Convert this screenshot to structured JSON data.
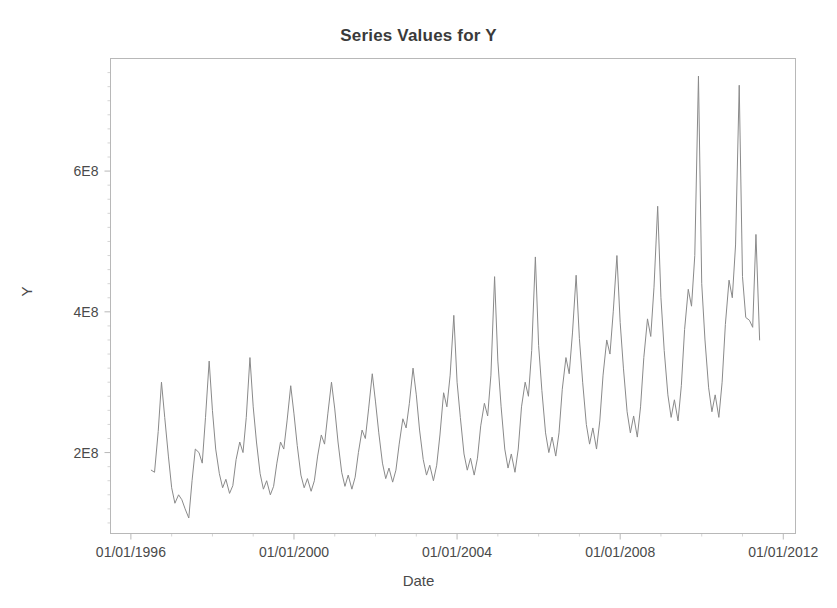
{
  "chart_data": {
    "type": "line",
    "title": "Series Values for Y",
    "xlabel": "Date",
    "ylabel": "Y",
    "grid": false,
    "legend": "none",
    "xtick_labels": [
      "01/01/1996",
      "01/01/2000",
      "01/01/2004",
      "01/01/2008",
      "01/01/2012"
    ],
    "xtick_values": [
      1996.0,
      2000.0,
      2004.0,
      2008.0,
      2012.0
    ],
    "ytick_labels": [
      "2E8",
      "4E8",
      "6E8"
    ],
    "ytick_values": [
      200000000,
      400000000,
      600000000
    ],
    "xlim": [
      1995.5,
      2012.3
    ],
    "ylim": [
      85000000,
      760000000
    ],
    "line_color": "#8a8a8a",
    "axis_color": "#b8b8b8",
    "series": [
      {
        "name": "Y",
        "x": [
          1996.5,
          1996.58,
          1996.67,
          1996.75,
          1996.83,
          1996.92,
          1997.0,
          1997.08,
          1997.17,
          1997.25,
          1997.33,
          1997.42,
          1997.5,
          1997.58,
          1997.67,
          1997.75,
          1997.83,
          1997.92,
          1998.0,
          1998.08,
          1998.17,
          1998.25,
          1998.33,
          1998.42,
          1998.5,
          1998.58,
          1998.67,
          1998.75,
          1998.83,
          1998.92,
          1999.0,
          1999.08,
          1999.17,
          1999.25,
          1999.33,
          1999.42,
          1999.5,
          1999.58,
          1999.67,
          1999.75,
          1999.83,
          1999.92,
          2000.0,
          2000.08,
          2000.17,
          2000.25,
          2000.33,
          2000.42,
          2000.5,
          2000.58,
          2000.67,
          2000.75,
          2000.83,
          2000.92,
          2001.0,
          2001.08,
          2001.17,
          2001.25,
          2001.33,
          2001.42,
          2001.5,
          2001.58,
          2001.67,
          2001.75,
          2001.83,
          2001.92,
          2002.0,
          2002.08,
          2002.17,
          2002.25,
          2002.33,
          2002.42,
          2002.5,
          2002.58,
          2002.67,
          2002.75,
          2002.83,
          2002.92,
          2003.0,
          2003.08,
          2003.17,
          2003.25,
          2003.33,
          2003.42,
          2003.5,
          2003.58,
          2003.67,
          2003.75,
          2003.83,
          2003.92,
          2004.0,
          2004.08,
          2004.17,
          2004.25,
          2004.33,
          2004.42,
          2004.5,
          2004.58,
          2004.67,
          2004.75,
          2004.83,
          2004.92,
          2005.0,
          2005.08,
          2005.17,
          2005.25,
          2005.33,
          2005.42,
          2005.5,
          2005.58,
          2005.67,
          2005.75,
          2005.83,
          2005.92,
          2006.0,
          2006.08,
          2006.17,
          2006.25,
          2006.33,
          2006.42,
          2006.5,
          2006.58,
          2006.67,
          2006.75,
          2006.83,
          2006.92,
          2007.0,
          2007.08,
          2007.17,
          2007.25,
          2007.33,
          2007.42,
          2007.5,
          2007.58,
          2007.67,
          2007.75,
          2007.83,
          2007.92,
          2008.0,
          2008.08,
          2008.17,
          2008.25,
          2008.33,
          2008.42,
          2008.5,
          2008.58,
          2008.67,
          2008.75,
          2008.83,
          2008.92,
          2009.0,
          2009.08,
          2009.17,
          2009.25,
          2009.33,
          2009.42,
          2009.5,
          2009.58,
          2009.67,
          2009.75,
          2009.83,
          2009.92,
          2010.0,
          2010.08,
          2010.17,
          2010.25,
          2010.33,
          2010.42,
          2010.5,
          2010.58,
          2010.67,
          2010.75,
          2010.83,
          2010.92,
          2011.0,
          2011.08,
          2011.17,
          2011.25,
          2011.33,
          2011.42
        ],
        "values": [
          175000000,
          172000000,
          230000000,
          300000000,
          250000000,
          195000000,
          150000000,
          128000000,
          140000000,
          133000000,
          120000000,
          107000000,
          160000000,
          205000000,
          200000000,
          185000000,
          250000000,
          330000000,
          260000000,
          205000000,
          170000000,
          150000000,
          162000000,
          142000000,
          153000000,
          190000000,
          215000000,
          200000000,
          250000000,
          335000000,
          265000000,
          215000000,
          170000000,
          148000000,
          160000000,
          140000000,
          152000000,
          185000000,
          215000000,
          205000000,
          245000000,
          295000000,
          255000000,
          210000000,
          168000000,
          150000000,
          163000000,
          145000000,
          160000000,
          195000000,
          225000000,
          212000000,
          255000000,
          300000000,
          262000000,
          215000000,
          172000000,
          152000000,
          168000000,
          148000000,
          165000000,
          200000000,
          232000000,
          220000000,
          262000000,
          312000000,
          272000000,
          228000000,
          185000000,
          163000000,
          178000000,
          158000000,
          175000000,
          212000000,
          248000000,
          235000000,
          270000000,
          320000000,
          282000000,
          232000000,
          190000000,
          168000000,
          182000000,
          160000000,
          182000000,
          225000000,
          285000000,
          265000000,
          310000000,
          395000000,
          300000000,
          250000000,
          198000000,
          175000000,
          192000000,
          168000000,
          192000000,
          238000000,
          270000000,
          252000000,
          310000000,
          450000000,
          330000000,
          265000000,
          205000000,
          178000000,
          198000000,
          172000000,
          205000000,
          265000000,
          300000000,
          280000000,
          345000000,
          478000000,
          352000000,
          288000000,
          228000000,
          200000000,
          222000000,
          195000000,
          228000000,
          290000000,
          335000000,
          312000000,
          370000000,
          452000000,
          362000000,
          300000000,
          240000000,
          212000000,
          235000000,
          205000000,
          245000000,
          310000000,
          360000000,
          340000000,
          400000000,
          480000000,
          385000000,
          320000000,
          258000000,
          228000000,
          252000000,
          222000000,
          265000000,
          335000000,
          390000000,
          365000000,
          435000000,
          550000000,
          420000000,
          345000000,
          282000000,
          250000000,
          275000000,
          245000000,
          295000000,
          375000000,
          432000000,
          408000000,
          480000000,
          735000000,
          440000000,
          360000000,
          292000000,
          258000000,
          282000000,
          250000000,
          300000000,
          382000000,
          445000000,
          420000000,
          495000000,
          722000000,
          450000000,
          392000000,
          388000000,
          378000000,
          510000000,
          360000000
        ]
      }
    ]
  },
  "axis_titles": {
    "x": "Date",
    "y": "Y"
  },
  "title": "Series Values for Y"
}
